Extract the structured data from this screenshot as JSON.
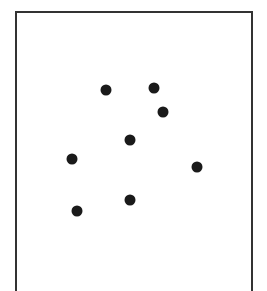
{
  "diagram": {
    "frame": {
      "left": 15,
      "top": 11,
      "width": 238,
      "border_color": "#333333"
    },
    "dot_color": "#1a1a1a",
    "dots": [
      {
        "x": 106,
        "y": 90
      },
      {
        "x": 154,
        "y": 88
      },
      {
        "x": 163,
        "y": 112
      },
      {
        "x": 130,
        "y": 140
      },
      {
        "x": 72,
        "y": 159
      },
      {
        "x": 197,
        "y": 167
      },
      {
        "x": 130,
        "y": 200
      },
      {
        "x": 77,
        "y": 211
      }
    ]
  }
}
